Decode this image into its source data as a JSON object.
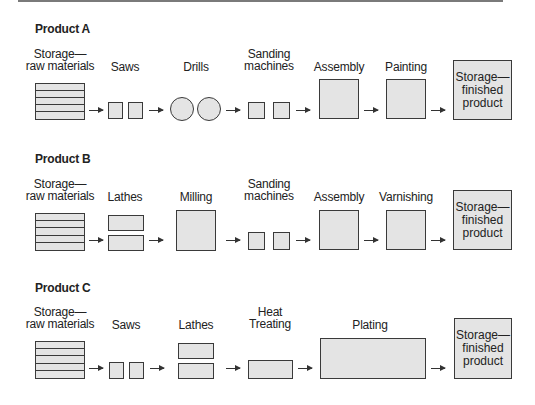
{
  "products": [
    {
      "title": "Product A",
      "labels": [
        "Storage—\nraw materials",
        "Saws",
        "Drills",
        "Sanding\nmachines",
        "Assembly",
        "Painting"
      ],
      "finished": "Storage—\nfinished\nproduct"
    },
    {
      "title": "Product B",
      "labels": [
        "Storage—\nraw materials",
        "Lathes",
        "Milling",
        "Sanding\nmachines",
        "Assembly",
        "Varnishing"
      ],
      "finished": "Storage—\nfinished\nproduct"
    },
    {
      "title": "Product C",
      "labels": [
        "Storage—\nraw materials",
        "Saws",
        "Lathes",
        "Heat\nTreating",
        "Plating"
      ],
      "finished": "Storage—\nfinished\nproduct"
    }
  ],
  "colors": {
    "fill": "#e4e4e4",
    "stroke": "#3a3a3a"
  }
}
